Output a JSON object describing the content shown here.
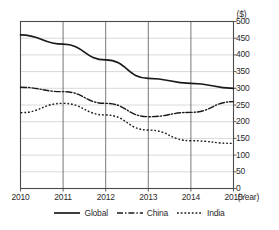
{
  "chart_data": {
    "type": "line",
    "title": "",
    "xlabel": "(Year)",
    "ylabel": "($)",
    "x": [
      2010,
      2011,
      2012,
      2013,
      2014,
      2015
    ],
    "xticklabels": [
      "2010",
      "2011",
      "2012",
      "2013",
      "2014",
      "2015"
    ],
    "yticklabels": [
      "0",
      "50",
      "100",
      "150",
      "200",
      "250",
      "300",
      "350",
      "400",
      "450",
      "500"
    ],
    "yticks": [
      0,
      50,
      100,
      150,
      200,
      250,
      300,
      350,
      400,
      450,
      500
    ],
    "ylim": [
      0,
      500
    ],
    "xlim": [
      2010,
      2015
    ],
    "grid": true,
    "legend_position": "bottom",
    "series": [
      {
        "name": "Global",
        "style": "solid",
        "color": "#1a1a1a",
        "values": [
          460,
          432,
          385,
          330,
          315,
          300
        ]
      },
      {
        "name": "China",
        "style": "dash-dot",
        "color": "#1a1a1a",
        "values": [
          303,
          290,
          255,
          215,
          228,
          260
        ]
      },
      {
        "name": "India",
        "style": "dotted",
        "color": "#1a1a1a",
        "values": [
          227,
          255,
          220,
          175,
          143,
          135
        ]
      }
    ]
  },
  "axis": {
    "unit_y": "($)",
    "unit_x": "(Year)"
  },
  "legend": {
    "items": [
      {
        "label": "Global"
      },
      {
        "label": "China"
      },
      {
        "label": "India"
      }
    ]
  }
}
